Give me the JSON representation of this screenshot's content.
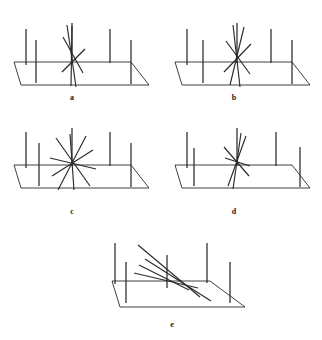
{
  "figure": {
    "background_color": "#ffffff",
    "stroke_color": "#2a2a2a",
    "label_color": "#1a1a1a",
    "panel_count": 5,
    "panels": [
      {
        "id": "a",
        "label": "a",
        "label_x": 72,
        "label_y": 100,
        "origin_x": 0,
        "origin_y": 0,
        "description": "ground plane with vertical posts and a tight near-vertical line bundle at center",
        "ground": {
          "name": "ground-plane-parallelogram",
          "points": "14,62 131,62 149,85 21,85",
          "closed": false,
          "edges": [
            {
              "name": "back-edge",
              "x1": 14,
              "y1": 62,
              "x2": 131,
              "y2": 62
            },
            {
              "name": "right-edge",
              "x1": 131,
              "y1": 62,
              "x2": 149,
              "y2": 85
            },
            {
              "name": "front-edge",
              "x1": 149,
              "y1": 85,
              "x2": 21,
              "y2": 85
            },
            {
              "name": "left-edge",
              "x1": 21,
              "y1": 85,
              "x2": 14,
              "y2": 62
            }
          ]
        },
        "posts": [
          {
            "name": "post-back-1",
            "x1": 26,
            "y1": 29,
            "x2": 26,
            "y2": 65
          },
          {
            "name": "post-front-1",
            "x1": 36,
            "y1": 40,
            "x2": 36,
            "y2": 83
          },
          {
            "name": "post-back-2",
            "x1": 72,
            "y1": 23,
            "x2": 72,
            "y2": 63
          },
          {
            "name": "post-back-3",
            "x1": 110,
            "y1": 29,
            "x2": 110,
            "y2": 63
          },
          {
            "name": "post-front-2",
            "x1": 131,
            "y1": 40,
            "x2": 131,
            "y2": 84
          }
        ],
        "bundle": {
          "name": "line-bundle-center",
          "center_x": 72,
          "center_y": 63,
          "spread": "narrow",
          "lines": [
            {
              "name": "bundle-line-1",
              "x1": 67,
              "y1": 25,
              "x2": 76,
              "y2": 87
            },
            {
              "name": "bundle-line-2",
              "x1": 72,
              "y1": 26,
              "x2": 71,
              "y2": 86
            },
            {
              "name": "bundle-line-3",
              "x1": 63,
              "y1": 37,
              "x2": 83,
              "y2": 73
            },
            {
              "name": "bundle-line-4",
              "x1": 62,
              "y1": 72,
              "x2": 85,
              "y2": 49
            }
          ]
        }
      },
      {
        "id": "b",
        "label": "b",
        "label_x": 234,
        "label_y": 100,
        "origin_x": 161,
        "origin_y": 0,
        "description": "ground plane with vertical posts and a moderately spread line bundle at center",
        "ground": {
          "name": "ground-plane-parallelogram",
          "points": "175,62 292,62 310,85 182,85",
          "closed": false,
          "edges": [
            {
              "name": "back-edge",
              "x1": 175,
              "y1": 62,
              "x2": 292,
              "y2": 62
            },
            {
              "name": "right-edge",
              "x1": 292,
              "y1": 62,
              "x2": 310,
              "y2": 85
            },
            {
              "name": "front-edge",
              "x1": 310,
              "y1": 85,
              "x2": 182,
              "y2": 85
            },
            {
              "name": "left-edge",
              "x1": 182,
              "y1": 85,
              "x2": 175,
              "y2": 62
            }
          ]
        },
        "posts": [
          {
            "name": "post-back-1",
            "x1": 187,
            "y1": 29,
            "x2": 187,
            "y2": 65
          },
          {
            "name": "post-front-1",
            "x1": 203,
            "y1": 40,
            "x2": 203,
            "y2": 83
          },
          {
            "name": "post-back-2",
            "x1": 237,
            "y1": 23,
            "x2": 237,
            "y2": 63
          },
          {
            "name": "post-back-3",
            "x1": 271,
            "y1": 29,
            "x2": 271,
            "y2": 63
          },
          {
            "name": "post-front-2",
            "x1": 292,
            "y1": 40,
            "x2": 292,
            "y2": 84
          }
        ],
        "bundle": {
          "name": "line-bundle-center",
          "center_x": 237,
          "center_y": 63,
          "spread": "medium",
          "lines": [
            {
              "name": "bundle-line-1",
              "x1": 233,
              "y1": 25,
              "x2": 240,
              "y2": 87
            },
            {
              "name": "bundle-line-2",
              "x1": 244,
              "y1": 27,
              "x2": 230,
              "y2": 85
            },
            {
              "name": "bundle-line-3",
              "x1": 226,
              "y1": 41,
              "x2": 250,
              "y2": 74
            },
            {
              "name": "bundle-line-4",
              "x1": 224,
              "y1": 72,
              "x2": 251,
              "y2": 44
            }
          ]
        }
      },
      {
        "id": "c",
        "label": "c",
        "label_x": 72,
        "label_y": 214,
        "origin_x": 0,
        "origin_y": 115,
        "description": "ground plane with vertical posts and a wide asterisk-like line burst at center",
        "ground": {
          "name": "ground-plane-parallelogram",
          "points": "14,165 131,165 149,188 21,188",
          "closed": false,
          "edges": [
            {
              "name": "back-edge",
              "x1": 14,
              "y1": 165,
              "x2": 131,
              "y2": 165
            },
            {
              "name": "right-edge",
              "x1": 131,
              "y1": 165,
              "x2": 149,
              "y2": 188
            },
            {
              "name": "front-edge",
              "x1": 149,
              "y1": 188,
              "x2": 21,
              "y2": 188
            },
            {
              "name": "left-edge",
              "x1": 21,
              "y1": 188,
              "x2": 14,
              "y2": 165
            }
          ]
        },
        "posts": [
          {
            "name": "post-back-1",
            "x1": 26,
            "y1": 132,
            "x2": 26,
            "y2": 168
          },
          {
            "name": "post-front-1",
            "x1": 39,
            "y1": 143,
            "x2": 39,
            "y2": 186
          },
          {
            "name": "post-back-2",
            "x1": 72,
            "y1": 128,
            "x2": 72,
            "y2": 166
          },
          {
            "name": "post-back-3",
            "x1": 110,
            "y1": 132,
            "x2": 110,
            "y2": 166
          },
          {
            "name": "post-front-2",
            "x1": 131,
            "y1": 143,
            "x2": 131,
            "y2": 187
          }
        ],
        "bundle": {
          "name": "line-bundle-center",
          "center_x": 72,
          "center_y": 164,
          "spread": "wide",
          "lines": [
            {
              "name": "bundle-line-1",
              "x1": 70,
              "y1": 134,
              "x2": 74,
              "y2": 190
            },
            {
              "name": "bundle-line-2",
              "x1": 86,
              "y1": 136,
              "x2": 58,
              "y2": 190
            },
            {
              "name": "bundle-line-3",
              "x1": 56,
              "y1": 138,
              "x2": 90,
              "y2": 186
            },
            {
              "name": "bundle-line-4",
              "x1": 50,
              "y1": 158,
              "x2": 96,
              "y2": 169
            },
            {
              "name": "bundle-line-5",
              "x1": 52,
              "y1": 176,
              "x2": 93,
              "y2": 150
            }
          ]
        }
      },
      {
        "id": "d",
        "label": "d",
        "label_x": 234,
        "label_y": 214,
        "origin_x": 161,
        "origin_y": 115,
        "description": "ground plane with vertical posts and a narrow tilted line bundle at center",
        "ground": {
          "name": "ground-plane-parallelogram",
          "points": "175,165 292,165 310,188 182,188",
          "closed": false,
          "edges": [
            {
              "name": "back-edge",
              "x1": 175,
              "y1": 165,
              "x2": 292,
              "y2": 165
            },
            {
              "name": "right-edge",
              "x1": 292,
              "y1": 165,
              "x2": 310,
              "y2": 188
            },
            {
              "name": "front-edge",
              "x1": 310,
              "y1": 188,
              "x2": 182,
              "y2": 188
            },
            {
              "name": "left-edge",
              "x1": 182,
              "y1": 188,
              "x2": 175,
              "y2": 165
            }
          ]
        },
        "posts": [
          {
            "name": "post-back-1",
            "x1": 187,
            "y1": 132,
            "x2": 187,
            "y2": 168
          },
          {
            "name": "post-front-1",
            "x1": 194,
            "y1": 148,
            "x2": 194,
            "y2": 186
          },
          {
            "name": "post-back-2",
            "x1": 237,
            "y1": 128,
            "x2": 237,
            "y2": 166
          },
          {
            "name": "post-back-3",
            "x1": 276,
            "y1": 132,
            "x2": 276,
            "y2": 166
          },
          {
            "name": "post-front-2",
            "x1": 300,
            "y1": 147,
            "x2": 300,
            "y2": 187
          }
        ],
        "bundle": {
          "name": "line-bundle-center",
          "center_x": 237,
          "center_y": 164,
          "spread": "narrow-tilted",
          "lines": [
            {
              "name": "bundle-line-1",
              "x1": 241,
              "y1": 133,
              "x2": 233,
              "y2": 189
            },
            {
              "name": "bundle-line-2",
              "x1": 246,
              "y1": 136,
              "x2": 228,
              "y2": 186
            },
            {
              "name": "bundle-line-3",
              "x1": 224,
              "y1": 147,
              "x2": 249,
              "y2": 176
            },
            {
              "name": "bundle-line-4",
              "x1": 225,
              "y1": 158,
              "x2": 250,
              "y2": 166
            }
          ]
        }
      },
      {
        "id": "e",
        "label": "e",
        "label_x": 172,
        "label_y": 327,
        "origin_x": 80,
        "origin_y": 230,
        "description": "ground plane with vertical posts and shallow near-horizontal crossing lines at center",
        "ground": {
          "name": "ground-plane-parallelogram",
          "points": "112,281 210,281 245,307 120,307",
          "closed": false,
          "edges": [
            {
              "name": "back-edge",
              "x1": 112,
              "y1": 281,
              "x2": 210,
              "y2": 281
            },
            {
              "name": "right-edge",
              "x1": 210,
              "y1": 281,
              "x2": 245,
              "y2": 307
            },
            {
              "name": "front-edge",
              "x1": 245,
              "y1": 307,
              "x2": 120,
              "y2": 307
            },
            {
              "name": "left-edge",
              "x1": 120,
              "y1": 307,
              "x2": 112,
              "y2": 281
            }
          ]
        },
        "posts": [
          {
            "name": "post-back-1",
            "x1": 115,
            "y1": 243,
            "x2": 115,
            "y2": 284
          },
          {
            "name": "post-front-1",
            "x1": 126,
            "y1": 262,
            "x2": 126,
            "y2": 303
          },
          {
            "name": "post-back-2",
            "x1": 167,
            "y1": 255,
            "x2": 167,
            "y2": 288
          },
          {
            "name": "post-back-3",
            "x1": 207,
            "y1": 243,
            "x2": 207,
            "y2": 283
          },
          {
            "name": "post-front-2",
            "x1": 230,
            "y1": 262,
            "x2": 230,
            "y2": 303
          }
        ],
        "bundle": {
          "name": "line-bundle-center",
          "center_x": 167,
          "center_y": 283,
          "spread": "shallow",
          "lines": [
            {
              "name": "bundle-line-1",
              "x1": 138,
              "y1": 245,
              "x2": 200,
              "y2": 297
            },
            {
              "name": "bundle-line-2",
              "x1": 145,
              "y1": 259,
              "x2": 211,
              "y2": 301
            },
            {
              "name": "bundle-line-3",
              "x1": 134,
              "y1": 273,
              "x2": 198,
              "y2": 288
            },
            {
              "name": "bundle-line-4",
              "x1": 139,
              "y1": 265,
              "x2": 189,
              "y2": 290
            }
          ]
        }
      }
    ]
  }
}
